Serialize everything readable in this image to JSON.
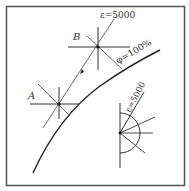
{
  "diagram": {
    "type": "strain-state diagram",
    "frame": {
      "color": "#444444"
    },
    "curve": {
      "label": "φ=100%",
      "color": "#222222"
    },
    "points": [
      {
        "id": "A",
        "label": "A"
      },
      {
        "id": "B",
        "label": "B"
      }
    ],
    "path_label": "ε=5000",
    "fan_label": "ε=5000",
    "line_color": "#333333"
  }
}
